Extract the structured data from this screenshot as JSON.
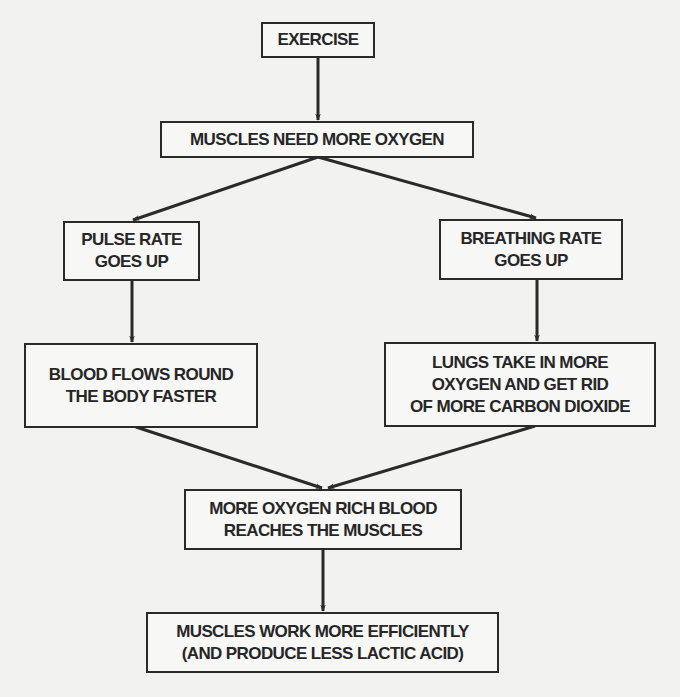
{
  "diagram": {
    "type": "flowchart",
    "colors": {
      "background": "#f2f2f1",
      "box_fill": "#f7f7f6",
      "stroke": "#2a2a2a",
      "text": "#262626"
    },
    "nodes": {
      "exercise": {
        "lines": [
          "EXERCISE"
        ]
      },
      "muscles_need_oxygen": {
        "lines": [
          "MUSCLES NEED MORE OXYGEN"
        ]
      },
      "pulse_rate": {
        "lines": [
          "PULSE RATE",
          "GOES UP"
        ]
      },
      "breathing_rate": {
        "lines": [
          "BREATHING RATE",
          "GOES UP"
        ]
      },
      "blood_flows": {
        "lines": [
          "BLOOD FLOWS ROUND",
          "THE BODY FASTER"
        ]
      },
      "lungs": {
        "lines": [
          "LUNGS TAKE IN MORE",
          "OXYGEN AND GET RID",
          "OF MORE CARBON DIOXIDE"
        ]
      },
      "oxygen_rich_blood": {
        "lines": [
          "MORE OXYGEN RICH BLOOD",
          "REACHES THE MUSCLES"
        ]
      },
      "muscles_efficient": {
        "lines": [
          "MUSCLES WORK MORE EFFICIENTLY",
          "(AND PRODUCE LESS LACTIC ACID)"
        ]
      }
    },
    "edges": [
      {
        "from": "exercise",
        "to": "muscles_need_oxygen"
      },
      {
        "from": "muscles_need_oxygen",
        "to": "pulse_rate"
      },
      {
        "from": "muscles_need_oxygen",
        "to": "breathing_rate"
      },
      {
        "from": "pulse_rate",
        "to": "blood_flows"
      },
      {
        "from": "breathing_rate",
        "to": "lungs"
      },
      {
        "from": "blood_flows",
        "to": "oxygen_rich_blood"
      },
      {
        "from": "lungs",
        "to": "oxygen_rich_blood"
      },
      {
        "from": "oxygen_rich_blood",
        "to": "muscles_efficient"
      }
    ]
  }
}
